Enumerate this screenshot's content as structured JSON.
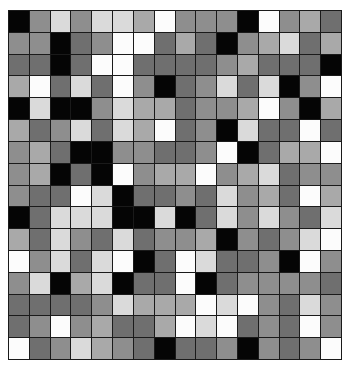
{
  "grid": {
    "rows": 16,
    "cols": 16,
    "palette": {
      "0": "#050505",
      "1": "#6f6f6f",
      "2": "#8e8e8e",
      "3": "#a9a9a9",
      "4": "#dadada",
      "5": "#fcfcfc"
    },
    "line_color": "#1a1a1a",
    "cells": [
      [
        0,
        2,
        4,
        2,
        4,
        4,
        3,
        5,
        2,
        2,
        2,
        0,
        5,
        2,
        3,
        1
      ],
      [
        2,
        2,
        0,
        1,
        2,
        5,
        5,
        1,
        3,
        1,
        0,
        2,
        3,
        4,
        1,
        3
      ],
      [
        1,
        1,
        0,
        1,
        5,
        5,
        1,
        1,
        1,
        1,
        2,
        3,
        1,
        1,
        1,
        0
      ],
      [
        3,
        5,
        1,
        4,
        1,
        5,
        2,
        0,
        1,
        2,
        4,
        1,
        4,
        0,
        2,
        5
      ],
      [
        0,
        4,
        0,
        0,
        2,
        4,
        3,
        3,
        1,
        2,
        2,
        3,
        5,
        2,
        0,
        3
      ],
      [
        3,
        1,
        2,
        4,
        1,
        4,
        3,
        5,
        1,
        2,
        0,
        4,
        1,
        1,
        5,
        1
      ],
      [
        2,
        3,
        1,
        0,
        0,
        2,
        2,
        1,
        1,
        2,
        5,
        0,
        1,
        3,
        3,
        5
      ],
      [
        2,
        3,
        0,
        1,
        0,
        5,
        2,
        3,
        3,
        5,
        2,
        3,
        4,
        1,
        2,
        2
      ],
      [
        2,
        1,
        1,
        5,
        4,
        0,
        1,
        1,
        2,
        1,
        4,
        2,
        3,
        1,
        5,
        3
      ],
      [
        0,
        1,
        4,
        4,
        4,
        0,
        0,
        4,
        0,
        1,
        4,
        2,
        4,
        2,
        1,
        4
      ],
      [
        3,
        1,
        4,
        2,
        1,
        4,
        1,
        2,
        2,
        3,
        0,
        2,
        1,
        2,
        4,
        5
      ],
      [
        5,
        2,
        4,
        1,
        4,
        5,
        0,
        1,
        5,
        4,
        1,
        1,
        2,
        0,
        5,
        2
      ],
      [
        2,
        4,
        0,
        3,
        4,
        0,
        1,
        1,
        5,
        0,
        1,
        2,
        2,
        2,
        2,
        1
      ],
      [
        1,
        1,
        1,
        1,
        2,
        4,
        3,
        3,
        3,
        5,
        4,
        5,
        2,
        1,
        4,
        2
      ],
      [
        1,
        2,
        5,
        2,
        3,
        1,
        1,
        3,
        5,
        4,
        5,
        1,
        2,
        1,
        5,
        2
      ],
      [
        5,
        1,
        2,
        4,
        3,
        2,
        1,
        0,
        1,
        1,
        2,
        0,
        2,
        1,
        2,
        5
      ]
    ]
  }
}
